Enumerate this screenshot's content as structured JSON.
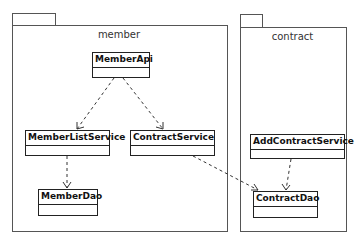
{
  "packages": [
    {
      "id": "member",
      "name": "member"
    },
    {
      "id": "contract",
      "name": "contract"
    }
  ],
  "classes": {
    "member_api": "MemberApi",
    "member_list_service": "MemberListService",
    "contract_service": "ContractService",
    "member_dao": "MemberDao",
    "add_contract_service": "AddContractService",
    "contract_dao": "ContractDao"
  },
  "dependencies": [
    {
      "from": "MemberApi",
      "to": "MemberListService",
      "style": "dashed",
      "arrow": "open"
    },
    {
      "from": "MemberApi",
      "to": "ContractService",
      "style": "dashed",
      "arrow": "open"
    },
    {
      "from": "MemberListService",
      "to": "MemberDao",
      "style": "dashed",
      "arrow": "open"
    },
    {
      "from": "ContractService",
      "to": "ContractDao",
      "style": "dashed",
      "arrow": "open"
    },
    {
      "from": "AddContractService",
      "to": "ContractDao",
      "style": "dashed",
      "arrow": "open"
    }
  ]
}
